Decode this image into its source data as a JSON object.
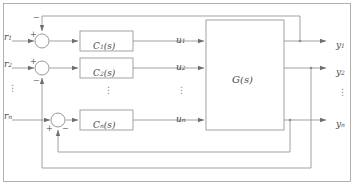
{
  "diagram": {
    "type": "control-block-diagram",
    "outer_frame": true,
    "plant": {
      "label": "G(s)",
      "name": "plant-block"
    },
    "channels": [
      {
        "index": 1,
        "reference_label": "r",
        "reference_sub": "1",
        "controller_label": "C",
        "controller_sub": "1",
        "controller_arg": "(s)",
        "control_signal_label": "u",
        "control_signal_sub": "1",
        "output_label": "y",
        "output_sub": "1",
        "sum_plus": "+",
        "sum_minus": "−",
        "feedback_direction": "top"
      },
      {
        "index": 2,
        "reference_label": "r",
        "reference_sub": "2",
        "controller_label": "C",
        "controller_sub": "2",
        "controller_arg": "(s)",
        "control_signal_label": "u",
        "control_signal_sub": "2",
        "output_label": "y",
        "output_sub": "2",
        "sum_plus": "+",
        "sum_minus": "−",
        "feedback_direction": "bottom"
      },
      {
        "index": 3,
        "reference_label": "r",
        "reference_sub": "n",
        "controller_label": "C",
        "controller_sub": "n",
        "controller_arg": "(s)",
        "control_signal_label": "u",
        "control_signal_sub": "n",
        "output_label": "y",
        "output_sub": "n",
        "sum_plus": "+",
        "sum_minus": "−",
        "feedback_direction": "bottom"
      }
    ],
    "ellipses": {
      "glyph": "⋮",
      "left_column": "⋮",
      "controller_column": "⋮",
      "signal_column": "⋮",
      "output_column": "⋮"
    },
    "colors": {
      "line": "#8c8c8c",
      "frame": "#a8a8a8",
      "text": "#4a4a4a",
      "sign": "#6a6a6a",
      "background": "#ffffff"
    }
  }
}
